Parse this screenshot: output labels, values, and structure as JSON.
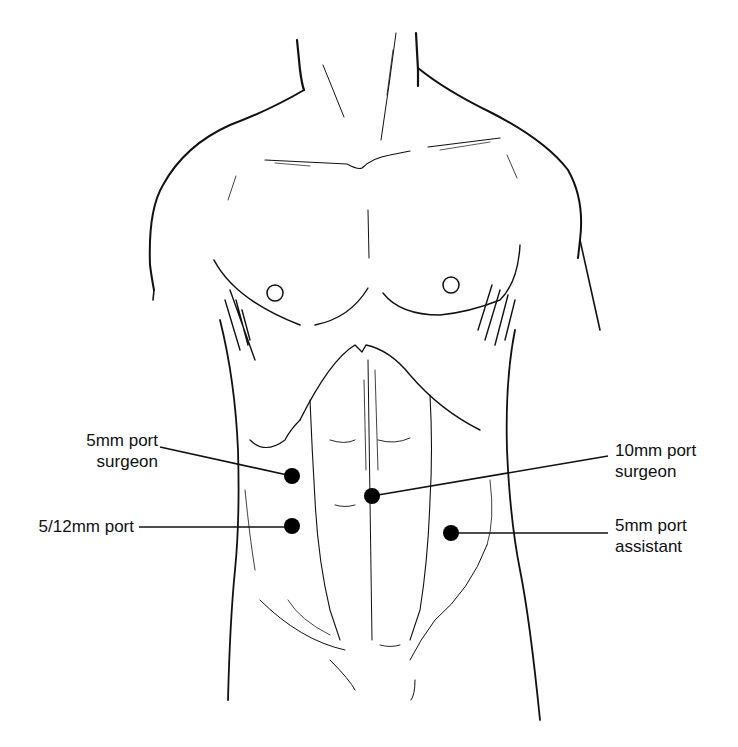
{
  "figure": {
    "colors": {
      "ink": "#111111",
      "background": "#ffffff",
      "port_marker": "#000000"
    }
  },
  "ports": [
    {
      "id": "port-5mm-surgeon",
      "line1": "5mm port",
      "line2": "surgeon",
      "marker_x": 292,
      "marker_y": 476,
      "side": "left"
    },
    {
      "id": "port-5-12mm",
      "line1": "5/12mm port",
      "line2": "",
      "marker_x": 292,
      "marker_y": 526,
      "side": "left"
    },
    {
      "id": "port-10mm-surgeon",
      "line1": "10mm port",
      "line2": "surgeon",
      "marker_x": 372,
      "marker_y": 496,
      "side": "right"
    },
    {
      "id": "port-5mm-assistant",
      "line1": "5mm port",
      "line2": "assistant",
      "marker_x": 451,
      "marker_y": 533,
      "side": "right"
    }
  ]
}
